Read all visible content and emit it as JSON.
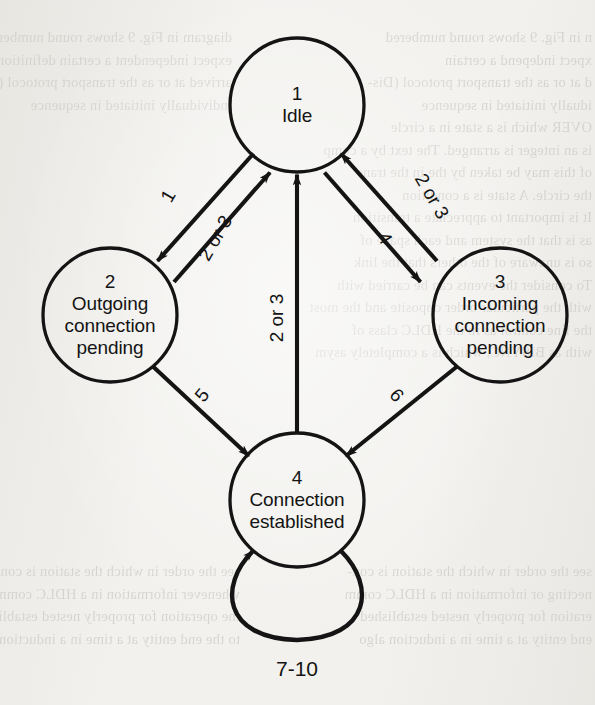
{
  "page": {
    "background_color": "#f2f1ee",
    "ink_color": "#141414"
  },
  "diagram": {
    "type": "state-transition-diagram",
    "node_radius": 67,
    "nodes": [
      {
        "id": "1",
        "number": "1",
        "name": "Idle",
        "label": "1\nIdle",
        "cx": 297,
        "cy": 105
      },
      {
        "id": "2",
        "number": "2",
        "name": "Outgoing connection pending",
        "label": "2\nOutgoing\nconnection\npending",
        "cx": 110,
        "cy": 315
      },
      {
        "id": "3",
        "number": "3",
        "name": "Incoming connection pending",
        "label": "3\nIncoming\nconnection\npending",
        "cx": 500,
        "cy": 315
      },
      {
        "id": "4",
        "number": "4",
        "name": "Connection established",
        "label": "4\nConnection\nestablished",
        "cx": 297,
        "cy": 500
      }
    ],
    "edges": [
      {
        "id": "e1",
        "from": "1",
        "to": "2",
        "label": "1",
        "label_rotation": -60,
        "label_x": 168,
        "label_y": 196
      },
      {
        "id": "e2",
        "from": "2",
        "to": "1",
        "label": "2 or 3",
        "label_rotation": -60,
        "label_x": 215,
        "label_y": 235
      },
      {
        "id": "e3",
        "from": "1",
        "to": "3",
        "label": "4",
        "label_rotation": 60,
        "label_x": 383,
        "label_y": 234
      },
      {
        "id": "e4",
        "from": "3",
        "to": "1",
        "label": "2 or 3",
        "label_rotation": 60,
        "label_x": 431,
        "label_y": 196
      },
      {
        "id": "e5",
        "from": "4",
        "to": "1",
        "label": "2 or 3",
        "label_rotation": -90,
        "label_x": 276,
        "label_y": 318
      },
      {
        "id": "e6",
        "from": "2",
        "to": "4",
        "label": "5",
        "label_rotation": -50,
        "label_x": 201,
        "label_y": 396
      },
      {
        "id": "e7",
        "from": "3",
        "to": "4",
        "label": "6",
        "label_rotation": 50,
        "label_x": 396,
        "label_y": 396
      },
      {
        "id": "e8",
        "from": "4",
        "to": "4",
        "label": "7-10",
        "label_rotation": 0,
        "label_x": 297,
        "label_y": 667,
        "self_loop": true
      }
    ]
  },
  "ghost_text": {
    "note": "faint bleed-through text from the reverse side of the scanned page",
    "left_column": "diagram in Fig. 9 shows round numbered\nexpect independent a certain definition\narrived at or as the transport protocol (Dis-\nindividually initiated in sequence",
    "right_column": "n in Fig. 9 shows round numbered\nxpect independ a certain\nd at or as the transport protocol (Dis-\nidually initiated in sequence\nOVER which is a state in a circle\nis an integer is arranged. The text by a comp\nof this may be taken by the in the trans\nthe circle. A state is a condition\nIt is important to appreciate a transition\nas is that the system and each space of\nso is unaware of the others that the link\nTo consider the events can be carried with\nwith the particular order opposite and the most\nthe line control as in the HDLC class of\nwith as BISYNC, which is a completely asym",
    "lower_left": "see the order in which the station is con-\nwhenever information in a HDLC comm\nthe operation for properly nested established\nto the end entity at a time in a induction algo",
    "lower_right": "see the order in which the station is con-\nnecting or information in a HDLC comm\neration for properly nested established\nend entity at a time in a induction algo"
  }
}
